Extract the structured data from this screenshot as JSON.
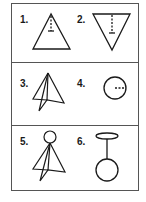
{
  "figure": {
    "rows": [
      {
        "cells": [
          {
            "number": "1.",
            "shape": "upright-triangle-with-dashed-axis"
          },
          {
            "number": "2.",
            "shape": "inverted-triangle-with-dashed-axis"
          }
        ]
      },
      {
        "cells": [
          {
            "number": "3.",
            "shape": "folded-cone"
          },
          {
            "number": "4.",
            "shape": "circle-with-dashed-radius"
          }
        ]
      },
      {
        "cells": [
          {
            "number": "5.",
            "shape": "folded-cone-with-head-circle"
          },
          {
            "number": "6.",
            "shape": "circle-on-stick-with-halo"
          }
        ]
      }
    ],
    "colors": {
      "stroke": "#1a1a1a",
      "border": "#555555",
      "background": "#ffffff"
    }
  }
}
